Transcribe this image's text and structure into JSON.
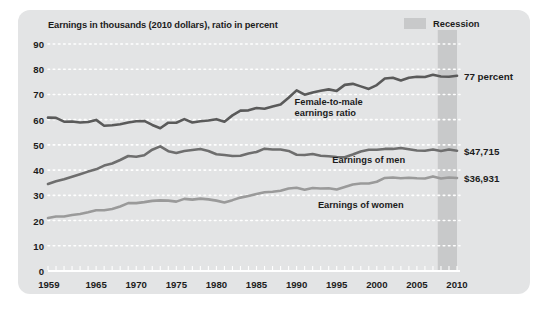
{
  "chart_data": {
    "type": "line",
    "title": "Earnings in thousands (2010 dollars), ratio in percent",
    "xlabel": "",
    "ylabel": "",
    "xlim": [
      1959,
      2010
    ],
    "ylim": [
      0,
      90
    ],
    "grid": "horizontal-dotted-white",
    "legend_position": "top-right",
    "x_ticks": [
      "1959",
      "1965",
      "1970",
      "1975",
      "1980",
      "1985",
      "1990",
      "1995",
      "2000",
      "2005",
      "2010"
    ],
    "x_tick_values": [
      1959,
      1965,
      1970,
      1975,
      1980,
      1985,
      1990,
      1995,
      2000,
      2005,
      2010
    ],
    "y_ticks": [
      "0",
      "10",
      "20",
      "30",
      "40",
      "50",
      "60",
      "70",
      "80",
      "90"
    ],
    "y_tick_values": [
      0,
      10,
      20,
      30,
      40,
      50,
      60,
      70,
      80,
      90
    ],
    "x": [
      1959,
      1960,
      1961,
      1962,
      1963,
      1964,
      1965,
      1966,
      1967,
      1968,
      1969,
      1970,
      1971,
      1972,
      1973,
      1974,
      1975,
      1976,
      1977,
      1978,
      1979,
      1980,
      1981,
      1982,
      1983,
      1984,
      1985,
      1986,
      1987,
      1988,
      1989,
      1990,
      1991,
      1992,
      1993,
      1994,
      1995,
      1996,
      1997,
      1998,
      1999,
      2000,
      2001,
      2002,
      2003,
      2004,
      2005,
      2006,
      2007,
      2008,
      2009,
      2010
    ],
    "series": [
      {
        "name": "Female-to-male earnings ratio",
        "unit": "percent",
        "color": "#5a5a5a",
        "end_label": "77 percent",
        "values": [
          60.8,
          60.7,
          59.2,
          59.3,
          58.9,
          59.1,
          59.9,
          57.6,
          57.8,
          58.2,
          58.9,
          59.4,
          59.5,
          57.9,
          56.6,
          58.8,
          58.8,
          60.2,
          58.9,
          59.4,
          59.7,
          60.2,
          59.2,
          61.7,
          63.6,
          63.7,
          64.6,
          64.3,
          65.2,
          66.0,
          68.7,
          71.6,
          69.9,
          70.8,
          71.5,
          72.0,
          71.4,
          73.8,
          74.2,
          73.2,
          72.2,
          73.7,
          76.3,
          76.6,
          75.5,
          76.6,
          77.0,
          76.9,
          77.8,
          77.1,
          77.0,
          77.4
        ]
      },
      {
        "name": "Earnings of men",
        "unit": "thousands of 2010 dollars",
        "color": "#6e6e6e",
        "end_label": "$47,715",
        "values": [
          34.5,
          35.6,
          36.4,
          37.4,
          38.4,
          39.4,
          40.3,
          41.8,
          42.6,
          44.0,
          45.6,
          45.3,
          45.9,
          48.1,
          49.4,
          47.5,
          46.8,
          47.6,
          48.0,
          48.4,
          47.6,
          46.3,
          46.0,
          45.6,
          45.7,
          46.6,
          47.2,
          48.5,
          48.2,
          48.2,
          47.6,
          46.1,
          46.0,
          46.4,
          45.7,
          45.5,
          45.2,
          45.1,
          46.2,
          47.4,
          48.1,
          48.1,
          48.4,
          48.4,
          48.8,
          48.3,
          47.8,
          47.7,
          48.2,
          47.6,
          48.2,
          47.7
        ]
      },
      {
        "name": "Earnings of women",
        "unit": "thousands of 2010 dollars",
        "color": "#9a9a9a",
        "end_label": "$36,931",
        "values": [
          21.0,
          21.6,
          21.6,
          22.2,
          22.6,
          23.3,
          24.1,
          24.1,
          24.6,
          25.6,
          26.9,
          26.9,
          27.3,
          27.8,
          28.0,
          27.9,
          27.5,
          28.6,
          28.3,
          28.7,
          28.4,
          27.9,
          27.2,
          28.1,
          29.1,
          29.7,
          30.5,
          31.2,
          31.4,
          31.8,
          32.7,
          33.0,
          32.2,
          32.9,
          32.7,
          32.8,
          32.3,
          33.3,
          34.3,
          34.7,
          34.7,
          35.4,
          36.9,
          37.1,
          36.8,
          37.0,
          36.8,
          36.7,
          37.5,
          36.7,
          37.1,
          36.9
        ]
      }
    ],
    "annotations": [
      {
        "name": "ratio-annotation",
        "text": "Female-to-male\nearnings ratio",
        "x": 1994,
        "y": 65
      },
      {
        "name": "men-annotation",
        "text": "Earnings of men",
        "x": 1999,
        "y": 44
      },
      {
        "name": "women-annotation",
        "text": "Earnings of women",
        "x": 1998,
        "y": 26
      }
    ],
    "shaded_regions": [
      {
        "name": "recession",
        "label": "Recession",
        "x_start": 2007.6,
        "x_end": 2010.0,
        "color": "#c8c9ca"
      }
    ],
    "legend": [
      {
        "label": "Recession",
        "color": "#c8c9ca",
        "type": "shaded-band"
      }
    ]
  },
  "colors": {
    "panel_background": "#e3e4e5",
    "page_background": "#ffffff",
    "grid": "#ffffff",
    "axis": "#ffffff",
    "text": "#1c1c1c",
    "recession_band": "#c8c9ca",
    "ratio_line": "#5a5a5a",
    "men_line": "#6e6e6e",
    "women_line": "#9a9a9a"
  }
}
